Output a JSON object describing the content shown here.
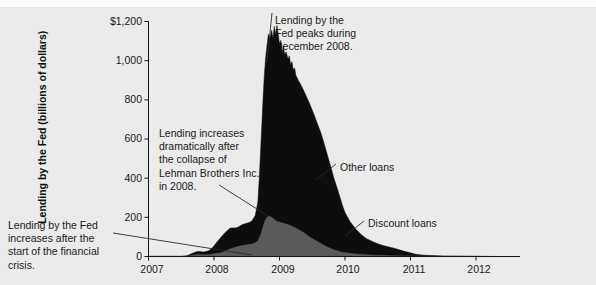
{
  "figure": {
    "background_color": "#ebebeb",
    "ink_color": "#111111"
  },
  "axes": {
    "y_title": "Lending by the Fed (billions of dollars)",
    "y_ticks": [
      "$1,200",
      "1,000",
      "800",
      "600",
      "400",
      "200",
      "0"
    ],
    "x_ticks": [
      "2007",
      "2008",
      "2009",
      "2010",
      "2011",
      "2012"
    ]
  },
  "annotations": {
    "peak": "Lending by the\nFed peaks during\nDecember 2008.",
    "lehman": "Lending increases\ndramatically after\nthe collapse of\nLehman Brothers Inc.\nin 2008.",
    "crisis_start": "Lending by the Fed\nincreases after the\nstart of the financial\ncrisis."
  },
  "series_labels": {
    "other_loans": "Other loans",
    "discount_loans": "Discount loans"
  },
  "chart_data": {
    "type": "area",
    "title": "",
    "subtitle": "",
    "xlabel": "",
    "ylabel": "Lending by the Fed (billions of dollars)",
    "stacked": true,
    "grid": false,
    "legend_position": "inline-callouts",
    "xlim": [
      2007.0,
      2012.6
    ],
    "ylim": [
      0,
      1200
    ],
    "x_tick_values": [
      2007,
      2008,
      2009,
      2010,
      2011,
      2012
    ],
    "y_tick_values": [
      0,
      200,
      400,
      600,
      800,
      1000,
      1200
    ],
    "colors": {
      "other_loans": "#0d0d0d",
      "discount_loans": "#5a5a5a"
    },
    "annotations": [
      {
        "text": "Lending by the Fed peaks during December 2008.",
        "x": 2008.96,
        "y": 1000
      },
      {
        "text": "Lending increases dramatically after the collapse of Lehman Brothers Inc. in 2008.",
        "x": 2008.72,
        "y": 180
      },
      {
        "text": "Lending by the Fed increases after the start of the financial crisis.",
        "x": 2007.72,
        "y": 8
      }
    ],
    "x": [
      2007.0,
      2007.08,
      2007.17,
      2007.25,
      2007.33,
      2007.42,
      2007.5,
      2007.58,
      2007.63,
      2007.67,
      2007.71,
      2007.75,
      2007.79,
      2007.83,
      2007.88,
      2007.92,
      2007.96,
      2008.0,
      2008.04,
      2008.08,
      2008.13,
      2008.17,
      2008.21,
      2008.25,
      2008.29,
      2008.33,
      2008.38,
      2008.42,
      2008.46,
      2008.5,
      2008.54,
      2008.58,
      2008.63,
      2008.67,
      2008.69,
      2008.71,
      2008.73,
      2008.75,
      2008.77,
      2008.79,
      2008.81,
      2008.83,
      2008.85,
      2008.88,
      2008.9,
      2008.92,
      2008.94,
      2008.96,
      2008.98,
      2009.0,
      2009.02,
      2009.04,
      2009.06,
      2009.08,
      2009.1,
      2009.13,
      2009.15,
      2009.17,
      2009.19,
      2009.21,
      2009.23,
      2009.25,
      2009.29,
      2009.33,
      2009.38,
      2009.42,
      2009.46,
      2009.5,
      2009.54,
      2009.58,
      2009.63,
      2009.67,
      2009.71,
      2009.75,
      2009.79,
      2009.83,
      2009.88,
      2009.92,
      2009.96,
      2010.0,
      2010.08,
      2010.17,
      2010.25,
      2010.33,
      2010.42,
      2010.5,
      2010.58,
      2010.67,
      2010.75,
      2010.83,
      2010.92,
      2011.0,
      2011.08,
      2011.17,
      2011.25,
      2011.5,
      2011.75,
      2012.0,
      2012.3,
      2012.6
    ],
    "series": [
      {
        "name": "Discount loans",
        "values": [
          1,
          1,
          1,
          1,
          1,
          1,
          1,
          2,
          4,
          6,
          8,
          10,
          10,
          9,
          9,
          10,
          12,
          14,
          16,
          18,
          22,
          28,
          34,
          40,
          44,
          48,
          52,
          56,
          58,
          60,
          62,
          64,
          70,
          80,
          95,
          110,
          130,
          155,
          175,
          190,
          200,
          205,
          205,
          200,
          195,
          190,
          185,
          180,
          178,
          176,
          174,
          172,
          170,
          168,
          166,
          163,
          160,
          158,
          155,
          152,
          148,
          145,
          138,
          130,
          120,
          110,
          100,
          92,
          84,
          76,
          68,
          60,
          52,
          46,
          40,
          35,
          30,
          26,
          22,
          20,
          16,
          13,
          11,
          9,
          8,
          7,
          6,
          5,
          4,
          4,
          3,
          3,
          2,
          2,
          2,
          1,
          1,
          1,
          0,
          0
        ]
      },
      {
        "name": "Other loans",
        "values": [
          0,
          0,
          0,
          0,
          0,
          0,
          0,
          2,
          6,
          10,
          14,
          16,
          15,
          14,
          16,
          20,
          28,
          40,
          55,
          70,
          85,
          95,
          100,
          105,
          102,
          98,
          100,
          105,
          108,
          110,
          112,
          118,
          140,
          200,
          300,
          420,
          540,
          660,
          760,
          830,
          880,
          930,
          905,
          955,
          920,
          985,
          945,
          1000,
          960,
          905,
          930,
          870,
          905,
          860,
          880,
          845,
          865,
          820,
          840,
          800,
          815,
          780,
          760,
          745,
          720,
          700,
          680,
          655,
          630,
          600,
          565,
          530,
          490,
          450,
          410,
          365,
          320,
          280,
          240,
          205,
          160,
          125,
          100,
          82,
          68,
          58,
          50,
          44,
          38,
          30,
          22,
          16,
          10,
          6,
          4,
          2,
          1,
          0,
          0,
          0
        ]
      }
    ]
  }
}
